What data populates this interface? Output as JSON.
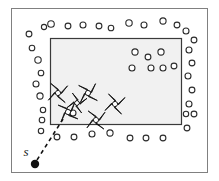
{
  "figure": {
    "name": "sensor-coverage-diagram",
    "background_color": "#ffffff",
    "outer_frame": {
      "name": "outer-boundary-rectangle",
      "x": 11.5,
      "y": 8.5,
      "width": 196,
      "height": 164,
      "stroke": "#808080",
      "fill": "none",
      "stroke_width": 1
    },
    "region_rect": {
      "name": "shaded-region-rectangle",
      "x": 50.5,
      "y": 38.5,
      "width": 131,
      "height": 86,
      "stroke": "#3a3a3a",
      "fill": "#f1f1f1",
      "stroke_width": 1.2
    },
    "start_point": {
      "name": "start-point-marker",
      "label": "s",
      "label_x": 26,
      "label_y": 156,
      "dot_x": 35,
      "dot_y": 164,
      "dot_radius": 4.2,
      "fill": "#111111"
    },
    "path": {
      "name": "dashed-entry-path",
      "x1": 37,
      "y1": 160,
      "x2": 63,
      "y2": 119,
      "stroke": "#111111",
      "stroke_width": 1.6,
      "dash": "4 3.5"
    },
    "circle_style": {
      "stroke": "#2b2b2b",
      "fill": "#ffffff",
      "stroke_width": 1.1,
      "radius_small": 2.6,
      "radius_large": 3.4
    },
    "star_style": {
      "fill": "#111111",
      "stroke": "#111111",
      "center_fill": "#ffffff",
      "size": 12
    },
    "circles": [
      {
        "name": "boundary-circle",
        "cx": 44,
        "cy": 27,
        "r": 2.6
      },
      {
        "name": "boundary-circle",
        "cx": 51,
        "cy": 24,
        "r": 3.3
      },
      {
        "name": "boundary-circle",
        "cx": 68,
        "cy": 26,
        "r": 2.9
      },
      {
        "name": "boundary-circle",
        "cx": 83,
        "cy": 25,
        "r": 3.0
      },
      {
        "name": "boundary-circle",
        "cx": 99,
        "cy": 26,
        "r": 2.9
      },
      {
        "name": "boundary-circle",
        "cx": 111,
        "cy": 28,
        "r": 2.8
      },
      {
        "name": "boundary-circle",
        "cx": 129,
        "cy": 23,
        "r": 3.2
      },
      {
        "name": "boundary-circle",
        "cx": 144,
        "cy": 25,
        "r": 3.0
      },
      {
        "name": "boundary-circle",
        "cx": 163,
        "cy": 21,
        "r": 3.1
      },
      {
        "name": "boundary-circle",
        "cx": 177,
        "cy": 25,
        "r": 2.9
      },
      {
        "name": "boundary-circle",
        "cx": 186,
        "cy": 31,
        "r": 3.0
      },
      {
        "name": "boundary-circle",
        "cx": 194,
        "cy": 40,
        "r": 2.9
      },
      {
        "name": "boundary-circle",
        "cx": 189,
        "cy": 50,
        "r": 3.0
      },
      {
        "name": "boundary-circle",
        "cx": 192,
        "cy": 63,
        "r": 2.9
      },
      {
        "name": "boundary-circle",
        "cx": 188,
        "cy": 76,
        "r": 3.0
      },
      {
        "name": "boundary-circle",
        "cx": 192,
        "cy": 90,
        "r": 2.9
      },
      {
        "name": "boundary-circle",
        "cx": 189,
        "cy": 104,
        "r": 3.0
      },
      {
        "name": "boundary-circle",
        "cx": 186,
        "cy": 114,
        "r": 2.7
      },
      {
        "name": "boundary-circle",
        "cx": 194,
        "cy": 114,
        "r": 2.9
      },
      {
        "name": "boundary-circle",
        "cx": 187,
        "cy": 128,
        "r": 2.9
      },
      {
        "name": "boundary-circle",
        "cx": 29,
        "cy": 34,
        "r": 2.9
      },
      {
        "name": "boundary-circle",
        "cx": 32,
        "cy": 48,
        "r": 2.8
      },
      {
        "name": "boundary-circle",
        "cx": 38,
        "cy": 60,
        "r": 3.2
      },
      {
        "name": "boundary-circle",
        "cx": 41,
        "cy": 73,
        "r": 2.8
      },
      {
        "name": "boundary-circle",
        "cx": 36,
        "cy": 84,
        "r": 3.0
      },
      {
        "name": "boundary-circle",
        "cx": 40,
        "cy": 96,
        "r": 3.1
      },
      {
        "name": "boundary-circle",
        "cx": 43,
        "cy": 110,
        "r": 2.7
      },
      {
        "name": "boundary-circle",
        "cx": 42,
        "cy": 120,
        "r": 2.8
      },
      {
        "name": "boundary-circle",
        "cx": 41,
        "cy": 131,
        "r": 2.7
      },
      {
        "name": "boundary-circle",
        "cx": 57,
        "cy": 137,
        "r": 2.9
      },
      {
        "name": "boundary-circle",
        "cx": 74,
        "cy": 137,
        "r": 2.9
      },
      {
        "name": "boundary-circle",
        "cx": 92,
        "cy": 134,
        "r": 3.0
      },
      {
        "name": "boundary-circle",
        "cx": 110,
        "cy": 133,
        "r": 3.1
      },
      {
        "name": "boundary-circle",
        "cx": 130,
        "cy": 138,
        "r": 2.9
      },
      {
        "name": "boundary-circle",
        "cx": 146,
        "cy": 138,
        "r": 2.9
      },
      {
        "name": "boundary-circle",
        "cx": 163,
        "cy": 138,
        "r": 2.9
      },
      {
        "name": "interior-circle",
        "cx": 135,
        "cy": 52,
        "r": 3.1
      },
      {
        "name": "interior-circle",
        "cx": 148,
        "cy": 57,
        "r": 2.9
      },
      {
        "name": "interior-circle",
        "cx": 161,
        "cy": 52,
        "r": 3.1
      },
      {
        "name": "interior-circle",
        "cx": 132,
        "cy": 68,
        "r": 3.0
      },
      {
        "name": "interior-circle",
        "cx": 151,
        "cy": 68,
        "r": 3.0
      },
      {
        "name": "interior-circle",
        "cx": 163,
        "cy": 68,
        "r": 3.0
      },
      {
        "name": "interior-circle",
        "cx": 174,
        "cy": 66,
        "r": 2.9
      },
      {
        "name": "interior-circle",
        "cx": 73,
        "cy": 113,
        "r": 3.0
      }
    ],
    "stars": [
      {
        "name": "robot-marker",
        "cx": 58,
        "cy": 93,
        "s": 12,
        "rot": 8
      },
      {
        "name": "robot-marker",
        "cx": 88,
        "cy": 93,
        "s": 12,
        "rot": -6
      },
      {
        "name": "robot-marker",
        "cx": 115,
        "cy": 104,
        "s": 12,
        "rot": 12
      },
      {
        "name": "robot-marker",
        "cx": 68,
        "cy": 112,
        "s": 12,
        "rot": -10
      },
      {
        "name": "robot-marker",
        "cx": 96,
        "cy": 120,
        "s": 12,
        "rot": 4
      },
      {
        "name": "robot-marker",
        "cx": 77,
        "cy": 103,
        "s": 11,
        "rot": 20
      }
    ]
  }
}
